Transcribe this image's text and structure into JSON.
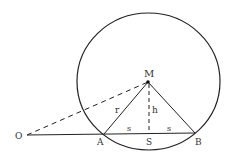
{
  "diagram": {
    "type": "geometry",
    "colors": {
      "stroke": "#222222",
      "label": "#333333",
      "background": "#ffffff"
    },
    "circle": {
      "cx": 148.5,
      "cy": 81.5,
      "rx": 71.5,
      "ry": 68.5
    },
    "points": {
      "M": {
        "x": 148,
        "y": 82,
        "label": "M"
      },
      "A": {
        "x": 104,
        "y": 134,
        "label": "A"
      },
      "B": {
        "x": 195,
        "y": 133,
        "label": "B"
      },
      "S": {
        "x": 149,
        "y": 133.5,
        "label": "S"
      },
      "O": {
        "x": 27,
        "y": 135,
        "label": "O"
      }
    },
    "segment_labels": {
      "r": "r",
      "h": "h",
      "s_left": "s",
      "s_right": "s"
    }
  }
}
